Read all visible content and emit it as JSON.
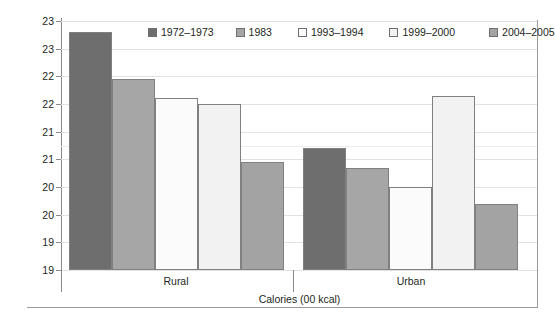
{
  "chart_data": {
    "type": "bar",
    "title": "",
    "subtitle": "",
    "xlabel": "Calories (00 kcal)",
    "ylabel": "",
    "categories": [
      "Rural",
      "Urban"
    ],
    "series": [
      {
        "name": "1972–1973",
        "color": "#6e6e6e",
        "values": [
          23.3,
          21.2
        ]
      },
      {
        "name": "1983",
        "color": "#a6a6a6",
        "values": [
          22.45,
          20.85
        ]
      },
      {
        "name": "1993–1994",
        "color": "#fbfbfb",
        "values": [
          22.1,
          20.5
        ]
      },
      {
        "name": "1999–2000",
        "color": "#f2f2f2",
        "values": [
          22.0,
          22.15
        ]
      },
      {
        "name": "2004–2005",
        "color": "#a3a3a3",
        "values": [
          20.95,
          20.2
        ]
      }
    ],
    "ylim": [
      19.0,
      23.5
    ],
    "ytick_values": [
      23.5,
      23.0,
      22.5,
      22.0,
      21.5,
      21.0,
      20.5,
      20.0,
      19.5,
      19.0
    ],
    "ytick_labels": [
      "23",
      "23",
      "22",
      "22",
      "21",
      "21",
      "20",
      "20",
      "19",
      "19"
    ],
    "grid": true,
    "legend_position": "top-center"
  }
}
